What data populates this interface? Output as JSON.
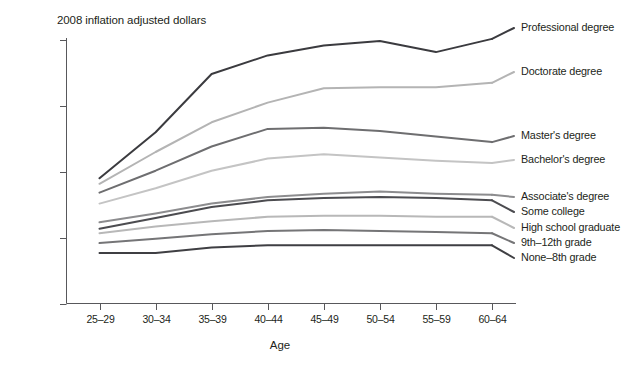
{
  "chart_data": {
    "type": "line",
    "title": "2008 inflation adjusted dollars",
    "xlabel": "Age",
    "ylabel": "",
    "categories": [
      "25–29",
      "30–34",
      "35–39",
      "40–44",
      "45–49",
      "50–54",
      "55–59",
      "60–64"
    ],
    "ytick_labels": [
      "$120,00",
      "$90,00",
      "$60,00",
      "$30,00",
      "$0"
    ],
    "ytick_values": [
      120000,
      90000,
      60000,
      30000,
      0
    ],
    "ylim": [
      0,
      130000
    ],
    "grid": false,
    "legend_position": "right",
    "series": [
      {
        "name": "Professional degree",
        "color": "#3b3b3f",
        "values": [
          57000,
          78000,
          104500,
          113000,
          117500,
          119500,
          114500,
          120500
        ]
      },
      {
        "name": "Doctorate degree",
        "color": "#b4b4b4",
        "values": [
          54500,
          69000,
          82500,
          91500,
          98000,
          98500,
          98500,
          100500
        ]
      },
      {
        "name": "Master's degree",
        "color": "#6e6e70",
        "values": [
          50500,
          60500,
          71500,
          79500,
          80000,
          78500,
          76000,
          73500
        ]
      },
      {
        "name": "Bachelor's degree",
        "color": "#c4c4c4",
        "values": [
          45500,
          52500,
          60500,
          66000,
          68000,
          66500,
          65000,
          64000
        ]
      },
      {
        "name": "Associate's degree",
        "color": "#8c8c8e",
        "values": [
          37000,
          41000,
          45500,
          48500,
          50000,
          51000,
          50000,
          49500
        ]
      },
      {
        "name": "Some college",
        "color": "#4c4c50",
        "values": [
          34000,
          39000,
          44000,
          47000,
          48000,
          48500,
          48000,
          47000
        ]
      },
      {
        "name": "High school graduate",
        "color": "#b8b8b8",
        "values": [
          32000,
          35000,
          37500,
          39500,
          40000,
          40000,
          39500,
          39500
        ]
      },
      {
        "name": "9th–12th grade",
        "color": "#757577",
        "values": [
          27500,
          29500,
          31500,
          33000,
          33500,
          33000,
          32500,
          32000
        ]
      },
      {
        "name": "None–8th grade",
        "color": "#3f3f43",
        "values": [
          23000,
          23000,
          25500,
          26500,
          26500,
          26500,
          26500,
          26500
        ]
      }
    ]
  },
  "axes": {
    "y_ticks": [
      {
        "label": "$120,00",
        "value": 120000
      },
      {
        "label": "$90,00",
        "value": 90000
      },
      {
        "label": "$60,00",
        "value": 60000
      },
      {
        "label": "$30,00",
        "value": 30000
      },
      {
        "label": "$0",
        "value": 0
      }
    ],
    "x_title": "Age"
  }
}
